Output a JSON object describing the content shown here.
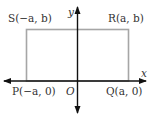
{
  "diagram": {
    "axes": {
      "x_label": "x",
      "y_label": "y",
      "origin_label": "O",
      "axis_color": "#111111"
    },
    "rectangle": {
      "stroke_color": "#a6a6a6",
      "vertices": [
        {
          "name": "S",
          "label": "S(−a, b)"
        },
        {
          "name": "R",
          "label": "R(a, b)"
        },
        {
          "name": "Q",
          "label": "Q(a, 0)"
        },
        {
          "name": "P",
          "label": "P(−a, 0)"
        }
      ]
    }
  }
}
